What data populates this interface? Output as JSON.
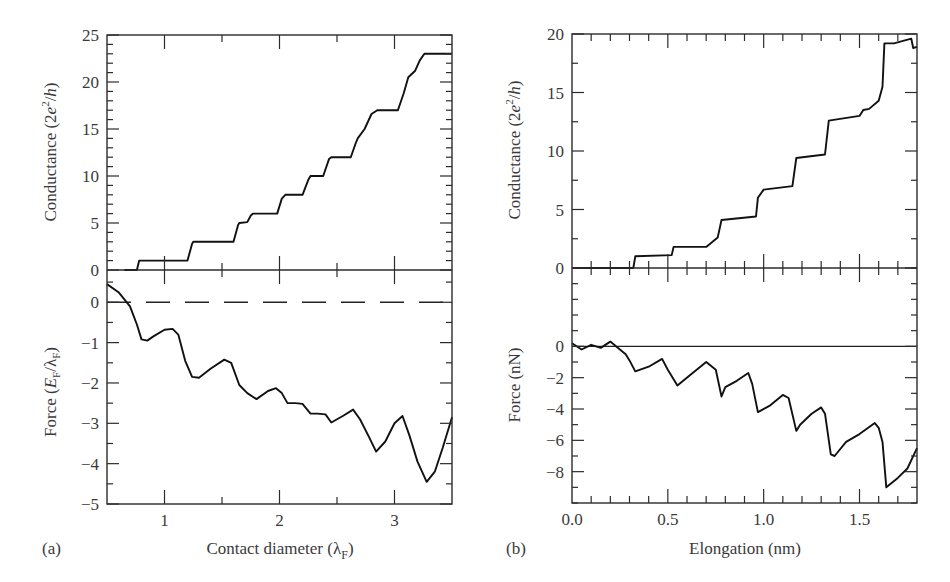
{
  "chart_data": [
    {
      "id": "a",
      "panel_label": "(a)",
      "type": "line",
      "xlabel": "Contact diameter (λF)",
      "xlabel_main": "Contact diameter (λ",
      "xlabel_sub": "F",
      "xlabel_close": ")",
      "xlim": [
        0.5,
        3.5
      ],
      "xticks": [
        1,
        2,
        3
      ],
      "xtick_labels": [
        "1",
        "2",
        "3"
      ],
      "subplots": [
        {
          "name": "conductance",
          "ylabel": "Conductance (2e²/h)",
          "ylim": [
            0,
            25
          ],
          "yticks": [
            0,
            5,
            10,
            15,
            20,
            25
          ],
          "ytick_labels": [
            "0",
            "5",
            "10",
            "15",
            "20",
            "25"
          ],
          "series": [
            {
              "name": "Conductance",
              "x": [
                0.65,
                0.76,
                0.78,
                1.2,
                1.24,
                1.25,
                1.6,
                1.64,
                1.65,
                1.72,
                1.75,
                1.77,
                1.98,
                2.02,
                2.05,
                2.2,
                2.25,
                2.27,
                2.38,
                2.43,
                2.45,
                2.62,
                2.66,
                2.68,
                2.74,
                2.8,
                2.85,
                3.03,
                3.08,
                3.12,
                3.18,
                3.22,
                3.26,
                3.5
              ],
              "y": [
                0,
                0,
                1,
                1,
                2.8,
                3,
                3,
                4.8,
                5,
                5.1,
                5.8,
                6,
                6,
                7.6,
                8,
                8,
                9.6,
                10,
                10,
                11.8,
                12,
                12,
                13.4,
                14,
                15,
                16.6,
                17,
                17,
                18.8,
                20.5,
                21.2,
                22.3,
                23,
                23
              ]
            }
          ]
        },
        {
          "name": "force",
          "ylabel": "Force (EF/λF)",
          "ylim": [
            -5,
            0.8
          ],
          "yticks": [
            -5,
            -4,
            -3,
            -2,
            -1,
            0
          ],
          "ytick_labels": [
            "−5",
            "−4",
            "−3",
            "−2",
            "−1",
            "0"
          ],
          "reference_line": {
            "y": 0,
            "style": "dashed"
          },
          "series": [
            {
              "name": "Force",
              "x": [
                0.5,
                0.6,
                0.7,
                0.76,
                0.8,
                0.85,
                0.9,
                1.0,
                1.07,
                1.12,
                1.18,
                1.24,
                1.3,
                1.4,
                1.52,
                1.58,
                1.65,
                1.72,
                1.8,
                1.9,
                1.97,
                2.02,
                2.07,
                2.14,
                2.2,
                2.27,
                2.33,
                2.4,
                2.45,
                2.55,
                2.64,
                2.7,
                2.78,
                2.84,
                2.92,
                3.0,
                3.07,
                3.13,
                3.2,
                3.28,
                3.35,
                3.42,
                3.5
              ],
              "y": [
                0.45,
                0.25,
                -0.1,
                -0.55,
                -0.92,
                -0.95,
                -0.85,
                -0.68,
                -0.66,
                -0.8,
                -1.45,
                -1.85,
                -1.87,
                -1.65,
                -1.42,
                -1.5,
                -2.05,
                -2.25,
                -2.4,
                -2.2,
                -2.13,
                -2.25,
                -2.5,
                -2.5,
                -2.52,
                -2.76,
                -2.76,
                -2.78,
                -2.98,
                -2.82,
                -2.66,
                -2.9,
                -3.35,
                -3.7,
                -3.45,
                -3.0,
                -2.82,
                -3.3,
                -3.95,
                -4.45,
                -4.2,
                -3.6,
                -2.85
              ]
            }
          ]
        }
      ]
    },
    {
      "id": "b",
      "panel_label": "(b)",
      "type": "line",
      "xlabel": "Elongation (nm)",
      "xlim": [
        0.0,
        1.8
      ],
      "xticks": [
        0.0,
        0.5,
        1.0,
        1.5
      ],
      "xtick_labels": [
        "0.0",
        "0.5",
        "1.0",
        "1.5"
      ],
      "subplots": [
        {
          "name": "conductance",
          "ylabel": "Conductance (2e²/h)",
          "ylim": [
            0,
            20
          ],
          "yticks": [
            0,
            5,
            10,
            15,
            20
          ],
          "ytick_labels": [
            "0",
            "5",
            "10",
            "15",
            "20"
          ],
          "series": [
            {
              "name": "Conductance",
              "x": [
                0.0,
                0.32,
                0.33,
                0.52,
                0.53,
                0.7,
                0.76,
                0.78,
                0.96,
                0.97,
                1.0,
                1.15,
                1.17,
                1.32,
                1.34,
                1.5,
                1.52,
                1.55,
                1.6,
                1.62,
                1.63,
                1.68,
                1.77,
                1.78,
                1.8
              ],
              "y": [
                0,
                0,
                1.0,
                1.1,
                1.8,
                1.8,
                2.6,
                4.1,
                4.4,
                6.0,
                6.7,
                7.0,
                9.4,
                9.7,
                12.6,
                13.0,
                13.5,
                13.6,
                14.3,
                15.5,
                19.2,
                19.2,
                19.6,
                18.8,
                18.9
              ]
            }
          ]
        },
        {
          "name": "force",
          "ylabel": "Force (nN)",
          "ylim": [
            -10,
            5
          ],
          "yticks": [
            -8,
            -6,
            -4,
            -2,
            0
          ],
          "ytick_labels": [
            "−8",
            "−6",
            "−4",
            "−2",
            "0"
          ],
          "reference_line": {
            "y": 0,
            "style": "solid"
          },
          "series": [
            {
              "name": "Force",
              "x": [
                0.0,
                0.05,
                0.1,
                0.15,
                0.2,
                0.25,
                0.28,
                0.3,
                0.33,
                0.4,
                0.47,
                0.5,
                0.55,
                0.62,
                0.7,
                0.75,
                0.78,
                0.8,
                0.86,
                0.92,
                0.94,
                0.97,
                1.03,
                1.1,
                1.13,
                1.17,
                1.19,
                1.25,
                1.3,
                1.32,
                1.35,
                1.37,
                1.43,
                1.5,
                1.58,
                1.6,
                1.62,
                1.64,
                1.7,
                1.75,
                1.8
              ],
              "y": [
                0.2,
                -0.2,
                0.1,
                -0.1,
                0.3,
                -0.2,
                -0.5,
                -0.9,
                -1.6,
                -1.3,
                -0.8,
                -1.5,
                -2.5,
                -1.8,
                -1.0,
                -1.5,
                -3.2,
                -2.6,
                -2.2,
                -1.7,
                -2.4,
                -4.2,
                -3.8,
                -3.1,
                -3.3,
                -5.4,
                -5.0,
                -4.3,
                -3.9,
                -4.3,
                -6.9,
                -7.0,
                -6.1,
                -5.6,
                -4.9,
                -5.2,
                -6.1,
                -9.0,
                -8.4,
                -7.8,
                -6.5
              ]
            }
          ]
        }
      ]
    }
  ]
}
